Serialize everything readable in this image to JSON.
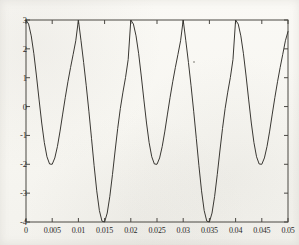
{
  "chart_data": {
    "type": "line",
    "title": "",
    "xlabel": "",
    "ylabel": "",
    "xlim": [
      0,
      0.05
    ],
    "ylim": [
      -4,
      3
    ],
    "grid": false,
    "legend": null,
    "xticks": [
      0,
      0.005,
      0.01,
      0.015,
      0.02,
      0.025,
      0.03,
      0.035,
      0.04,
      0.045,
      0.05
    ],
    "xtick_labels": [
      "0",
      "0.005",
      "0.01",
      "0.015",
      "0.02",
      "0.025",
      "0.03",
      "0.035",
      "0.04",
      "0.045",
      "0.05"
    ],
    "yticks": [
      3,
      2,
      1,
      0,
      -1,
      -2,
      -3,
      -4
    ],
    "ytick_labels": [
      "3",
      "2",
      "1",
      "0",
      "-1",
      "-2",
      "-3",
      "-4"
    ],
    "line_color": "#3a3833",
    "line_width": 1,
    "series": [
      {
        "name": "waveform",
        "description": "Periodic beat waveform: peaks of 3 at t = 0, 0.01, 0.02, 0.03, 0.04; alternating minima of -2 at t = 0.005, 0.025, 0.045 and -4 at t = 0.015, 0.035; envelope period 0.02 s",
        "peaks": [
          {
            "x": 0.0,
            "y": 3
          },
          {
            "x": 0.01,
            "y": 3
          },
          {
            "x": 0.02,
            "y": 3
          },
          {
            "x": 0.03,
            "y": 3
          },
          {
            "x": 0.04,
            "y": 3
          }
        ],
        "minima": [
          {
            "x": 0.005,
            "y": -2
          },
          {
            "x": 0.015,
            "y": -4
          },
          {
            "x": 0.025,
            "y": -2
          },
          {
            "x": 0.035,
            "y": -4
          },
          {
            "x": 0.045,
            "y": -2
          }
        ],
        "endpoint": {
          "x": 0.05,
          "y": 2.6
        },
        "x": [
          0,
          0.0005,
          0.001,
          0.0015,
          0.002,
          0.0025,
          0.003,
          0.0035,
          0.004,
          0.0045,
          0.005,
          0.0055,
          0.006,
          0.0065,
          0.007,
          0.0075,
          0.008,
          0.0085,
          0.009,
          0.0095,
          0.01,
          0.0105,
          0.011,
          0.0115,
          0.012,
          0.0125,
          0.013,
          0.0135,
          0.014,
          0.0145,
          0.015,
          0.0155,
          0.016,
          0.0165,
          0.017,
          0.0175,
          0.018,
          0.0185,
          0.019,
          0.0195,
          0.02,
          0.0205,
          0.021,
          0.0215,
          0.022,
          0.0225,
          0.023,
          0.0235,
          0.024,
          0.0245,
          0.025,
          0.0255,
          0.026,
          0.0265,
          0.027,
          0.0275,
          0.028,
          0.0285,
          0.029,
          0.0295,
          0.03,
          0.0305,
          0.031,
          0.0315,
          0.032,
          0.0325,
          0.033,
          0.0335,
          0.034,
          0.0345,
          0.035,
          0.0355,
          0.036,
          0.0365,
          0.037,
          0.0375,
          0.038,
          0.0385,
          0.039,
          0.0395,
          0.04,
          0.0405,
          0.041,
          0.0415,
          0.042,
          0.0425,
          0.043,
          0.0435,
          0.044,
          0.0445,
          0.045,
          0.0455,
          0.046,
          0.0465,
          0.047,
          0.0475,
          0.048,
          0.0485,
          0.049,
          0.0495,
          0.05
        ],
        "y": [
          3.0,
          2.86,
          2.45,
          1.83,
          1.06,
          0.23,
          -0.57,
          -1.25,
          -1.74,
          -1.99,
          -2.0,
          -1.78,
          -1.38,
          -0.85,
          -0.26,
          0.32,
          0.86,
          1.35,
          1.81,
          2.28,
          3.0,
          2.28,
          1.53,
          0.72,
          -0.16,
          -1.1,
          -2.05,
          -2.92,
          -3.6,
          -3.97,
          -4.0,
          -3.69,
          -3.11,
          -2.36,
          -1.54,
          -0.76,
          -0.07,
          0.5,
          1.01,
          1.63,
          3.0,
          2.86,
          2.45,
          1.83,
          1.06,
          0.23,
          -0.57,
          -1.25,
          -1.74,
          -1.99,
          -2.0,
          -1.78,
          -1.38,
          -0.85,
          -0.26,
          0.32,
          0.86,
          1.35,
          1.81,
          2.28,
          3.0,
          2.28,
          1.53,
          0.72,
          -0.16,
          -1.1,
          -2.05,
          -2.92,
          -3.6,
          -3.97,
          -4.0,
          -3.69,
          -3.11,
          -2.36,
          -1.54,
          -0.76,
          -0.07,
          0.5,
          1.01,
          1.63,
          3.0,
          2.86,
          2.45,
          1.83,
          1.06,
          0.23,
          -0.57,
          -1.25,
          -1.74,
          -1.99,
          -2.0,
          -1.78,
          -1.38,
          -0.85,
          -0.26,
          0.32,
          0.86,
          1.35,
          1.81,
          2.28,
          2.6
        ]
      }
    ]
  },
  "axes": {
    "frame_color": "#4a4843",
    "background": "#fbfaf7"
  }
}
